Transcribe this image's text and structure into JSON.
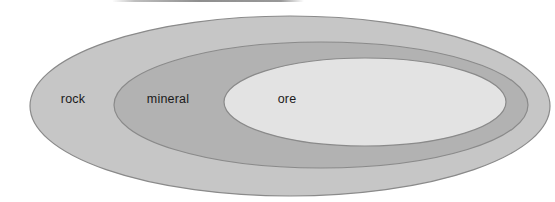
{
  "diagram": {
    "type": "nested-euler-diagram",
    "regions": [
      {
        "label": "rock",
        "fill": "#c6c6c6"
      },
      {
        "label": "mineral",
        "fill": "#b2b2b2"
      },
      {
        "label": "ore",
        "fill": "#e3e3e3"
      }
    ],
    "stroke_color": "#8a8a8a",
    "text_color": "#1a1a1a",
    "background": "#ffffff"
  }
}
